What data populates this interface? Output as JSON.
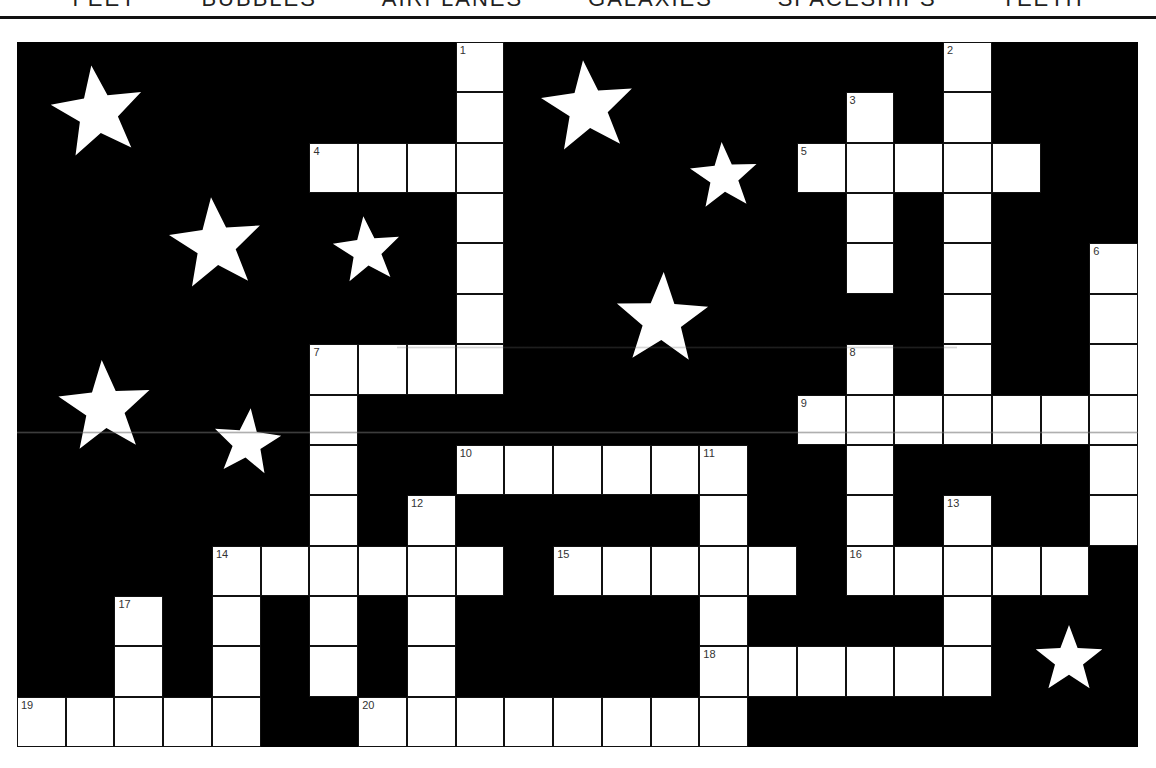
{
  "word_bank": [
    "FEET",
    "BUBBLES",
    "AIRPLANES",
    "GALAXIES",
    "SPACESHIPS",
    "TEETH"
  ],
  "grid": {
    "cols": 23,
    "rows": 14,
    "cell_width": 48.74,
    "cell_height": 50.36,
    "background_color": "#000000",
    "cell_color": "#ffffff",
    "white_cells": [
      [
        0,
        9
      ],
      [
        0,
        19
      ],
      [
        1,
        9
      ],
      [
        1,
        17
      ],
      [
        1,
        19
      ],
      [
        2,
        6
      ],
      [
        2,
        7
      ],
      [
        2,
        8
      ],
      [
        2,
        9
      ],
      [
        2,
        16
      ],
      [
        2,
        17
      ],
      [
        2,
        18
      ],
      [
        2,
        19
      ],
      [
        2,
        20
      ],
      [
        3,
        9
      ],
      [
        3,
        17
      ],
      [
        3,
        19
      ],
      [
        4,
        9
      ],
      [
        4,
        17
      ],
      [
        4,
        19
      ],
      [
        4,
        22
      ],
      [
        5,
        9
      ],
      [
        5,
        19
      ],
      [
        5,
        22
      ],
      [
        6,
        6
      ],
      [
        6,
        7
      ],
      [
        6,
        8
      ],
      [
        6,
        9
      ],
      [
        6,
        17
      ],
      [
        6,
        19
      ],
      [
        6,
        22
      ],
      [
        7,
        6
      ],
      [
        7,
        16
      ],
      [
        7,
        17
      ],
      [
        7,
        18
      ],
      [
        7,
        19
      ],
      [
        7,
        20
      ],
      [
        7,
        21
      ],
      [
        7,
        22
      ],
      [
        8,
        6
      ],
      [
        8,
        9
      ],
      [
        8,
        10
      ],
      [
        8,
        11
      ],
      [
        8,
        12
      ],
      [
        8,
        13
      ],
      [
        8,
        14
      ],
      [
        8,
        17
      ],
      [
        8,
        22
      ],
      [
        9,
        6
      ],
      [
        9,
        8
      ],
      [
        9,
        14
      ],
      [
        9,
        17
      ],
      [
        9,
        19
      ],
      [
        9,
        22
      ],
      [
        10,
        4
      ],
      [
        10,
        5
      ],
      [
        10,
        6
      ],
      [
        10,
        7
      ],
      [
        10,
        8
      ],
      [
        10,
        9
      ],
      [
        10,
        11
      ],
      [
        10,
        12
      ],
      [
        10,
        13
      ],
      [
        10,
        14
      ],
      [
        10,
        15
      ],
      [
        10,
        17
      ],
      [
        10,
        18
      ],
      [
        10,
        19
      ],
      [
        10,
        20
      ],
      [
        10,
        21
      ],
      [
        11,
        2
      ],
      [
        11,
        4
      ],
      [
        11,
        6
      ],
      [
        11,
        8
      ],
      [
        11,
        14
      ],
      [
        11,
        19
      ],
      [
        12,
        2
      ],
      [
        12,
        4
      ],
      [
        12,
        6
      ],
      [
        12,
        8
      ],
      [
        12,
        14
      ],
      [
        12,
        15
      ],
      [
        12,
        16
      ],
      [
        12,
        17
      ],
      [
        12,
        18
      ],
      [
        12,
        19
      ],
      [
        13,
        0
      ],
      [
        13,
        1
      ],
      [
        13,
        2
      ],
      [
        13,
        3
      ],
      [
        13,
        4
      ],
      [
        13,
        7
      ],
      [
        13,
        8
      ],
      [
        13,
        9
      ],
      [
        13,
        10
      ],
      [
        13,
        11
      ],
      [
        13,
        12
      ],
      [
        13,
        13
      ],
      [
        13,
        14
      ]
    ],
    "numbers": [
      {
        "n": "1",
        "row": 0,
        "col": 9
      },
      {
        "n": "2",
        "row": 0,
        "col": 19
      },
      {
        "n": "3",
        "row": 1,
        "col": 17
      },
      {
        "n": "4",
        "row": 2,
        "col": 6
      },
      {
        "n": "5",
        "row": 2,
        "col": 16
      },
      {
        "n": "6",
        "row": 4,
        "col": 22
      },
      {
        "n": "7",
        "row": 6,
        "col": 6
      },
      {
        "n": "8",
        "row": 6,
        "col": 17
      },
      {
        "n": "9",
        "row": 7,
        "col": 16
      },
      {
        "n": "10",
        "row": 8,
        "col": 9
      },
      {
        "n": "11",
        "row": 8,
        "col": 14
      },
      {
        "n": "12",
        "row": 9,
        "col": 8
      },
      {
        "n": "13",
        "row": 9,
        "col": 19
      },
      {
        "n": "14",
        "row": 10,
        "col": 4
      },
      {
        "n": "15",
        "row": 10,
        "col": 11
      },
      {
        "n": "16",
        "row": 10,
        "col": 17
      },
      {
        "n": "17",
        "row": 11,
        "col": 2
      },
      {
        "n": "18",
        "row": 12,
        "col": 14
      },
      {
        "n": "19",
        "row": 13,
        "col": 0
      },
      {
        "n": "20",
        "row": 13,
        "col": 7
      }
    ]
  },
  "entries": {
    "across": [
      {
        "n": "4",
        "length": 4
      },
      {
        "n": "5",
        "length": 5
      },
      {
        "n": "7",
        "length": 4
      },
      {
        "n": "9",
        "length": 7
      },
      {
        "n": "10",
        "length": 6
      },
      {
        "n": "14",
        "length": 6
      },
      {
        "n": "15",
        "length": 5
      },
      {
        "n": "16",
        "length": 5
      },
      {
        "n": "18",
        "length": 6
      },
      {
        "n": "19",
        "length": 5
      },
      {
        "n": "20",
        "length": 8
      }
    ],
    "down": [
      {
        "n": "1",
        "length": 7
      },
      {
        "n": "2",
        "length": 7
      },
      {
        "n": "3",
        "length": 4
      },
      {
        "n": "6",
        "length": 6
      },
      {
        "n": "7",
        "length": 7
      },
      {
        "n": "8",
        "length": 5
      },
      {
        "n": "11",
        "length": 6
      },
      {
        "n": "12",
        "length": 5
      },
      {
        "n": "13",
        "length": 4
      },
      {
        "n": "14",
        "length": 4
      },
      {
        "n": "17",
        "length": 3
      }
    ]
  },
  "stars": [
    {
      "cx": 81,
      "cy": 71,
      "r": 48,
      "rot": -8
    },
    {
      "cx": 199,
      "cy": 203,
      "r": 48,
      "rot": -6
    },
    {
      "cx": 350,
      "cy": 209,
      "r": 35,
      "rot": -6
    },
    {
      "cx": 88,
      "cy": 366,
      "r": 48,
      "rot": -4
    },
    {
      "cx": 230,
      "cy": 401,
      "r": 35,
      "rot": 6
    },
    {
      "cx": 571,
      "cy": 66,
      "r": 48,
      "rot": -6
    },
    {
      "cx": 707,
      "cy": 135,
      "r": 35,
      "rot": -4
    },
    {
      "cx": 645,
      "cy": 278,
      "r": 48,
      "rot": 2
    },
    {
      "cx": 1052,
      "cy": 618,
      "r": 35,
      "rot": 0
    }
  ],
  "colors": {
    "board": "#000000",
    "cell": "#ffffff",
    "grid_line": "#111111",
    "star": "#ffffff",
    "number": "#333333"
  }
}
